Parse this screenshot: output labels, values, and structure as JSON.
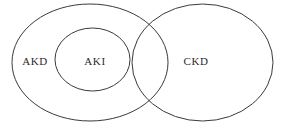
{
  "diagram": {
    "type": "venn-diagram",
    "canvas": {
      "width": 283,
      "height": 128,
      "background": "#ffffff"
    },
    "stroke_color": "#3a3a3a",
    "text_color": "#2b2b2b",
    "sets": [
      {
        "id": "akd",
        "label": "AKD",
        "label_x": 35,
        "label_y": 62,
        "ellipse": {
          "cx": 90,
          "cy": 62.5,
          "rx": 78,
          "ry": 58.5
        }
      },
      {
        "id": "aki",
        "label": "AKI",
        "label_x": 95,
        "label_y": 62,
        "ellipse": {
          "cx": 92.5,
          "cy": 59.5,
          "rx": 37.5,
          "ry": 31.5
        }
      },
      {
        "id": "ckd",
        "label": "CKD",
        "label_x": 196,
        "label_y": 62,
        "ellipse": {
          "cx": 202.5,
          "cy": 62.5,
          "rx": 70.5,
          "ry": 58.5
        }
      }
    ]
  }
}
